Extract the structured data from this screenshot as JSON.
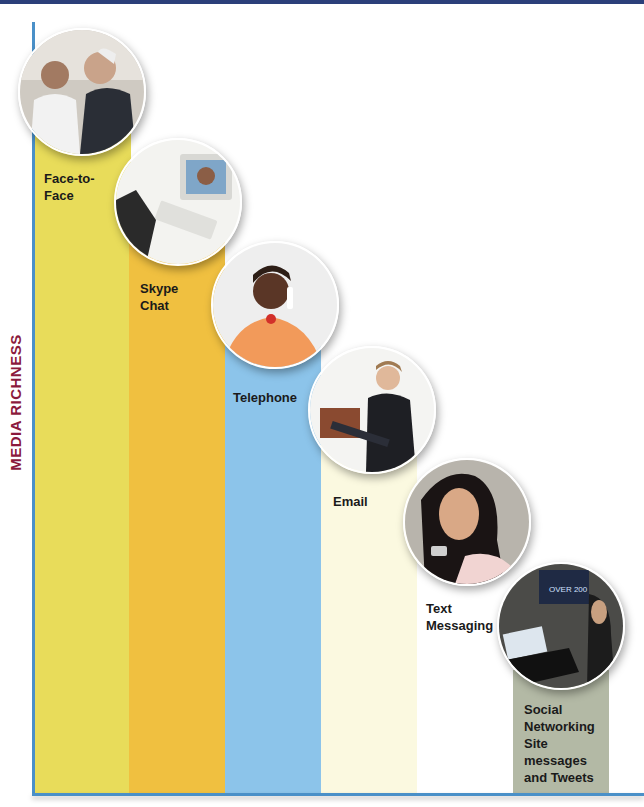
{
  "figure": {
    "y_axis_label": "MEDIA RICHNESS",
    "colors": {
      "top_bar": "#2b3f7a",
      "axis": "#4a90c8",
      "y_label": "#8b1a3c"
    },
    "steps": [
      {
        "label": "Face-to-\nFace",
        "color": "#e8dc5a",
        "photo": "doctor-and-patient-photo"
      },
      {
        "label": "Skype\nChat",
        "color": "#f0c040",
        "photo": "video-call-computer-photo"
      },
      {
        "label": "Telephone",
        "color": "#8cc4ea",
        "photo": "woman-on-phone-photo"
      },
      {
        "label": "Email",
        "color": "#fbf9e0",
        "photo": "woman-on-laptop-photo"
      },
      {
        "label": "Text\nMessaging",
        "color": "#ffffff",
        "photo": "woman-texting-photo"
      },
      {
        "label": "Social\nNetworking\nSite\nmessages\nand Tweets",
        "color": "#b3b9a5",
        "photo": "person-on-laptop-photo"
      }
    ]
  }
}
